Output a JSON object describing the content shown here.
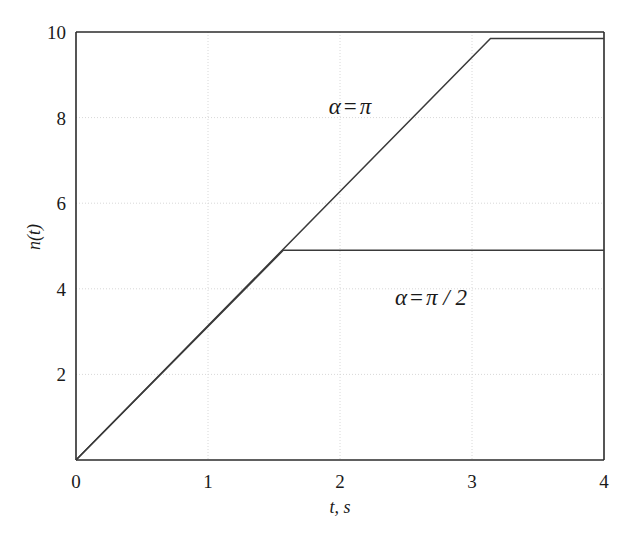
{
  "chart_data": {
    "type": "line",
    "title": "",
    "subtitle": "",
    "xlabel": "t, s",
    "ylabel": "n(t)",
    "xlim": [
      0,
      4
    ],
    "ylim": [
      0,
      10
    ],
    "xticks": [
      "0",
      "1",
      "2",
      "3",
      "4"
    ],
    "xtick_values": [
      0,
      1,
      2,
      3,
      4
    ],
    "yticks": [
      "2",
      "4",
      "6",
      "8",
      "10"
    ],
    "ytick_values": [
      2,
      4,
      6,
      8,
      10
    ],
    "grid": true,
    "grid_style": "dotted-faint",
    "legend_position": "inline-annotations",
    "line_color": "#3a3a3a",
    "axis_color": "#2b2b2b",
    "grid_color": "#d8d8d8",
    "background": "#ffffff",
    "series": [
      {
        "name": "alpha = pi",
        "annotation": "α = π",
        "annotation_x": 1.85,
        "annotation_y": 8.55,
        "x": [
          0,
          3.14,
          4
        ],
        "y": [
          0,
          9.85,
          9.85
        ]
      },
      {
        "name": "alpha = pi/2",
        "annotation": "α = π / 2",
        "annotation_x": 2.62,
        "annotation_y": 3.95,
        "x": [
          0,
          1.57,
          4
        ],
        "y": [
          0,
          4.9,
          4.9
        ]
      }
    ],
    "annotations": [
      {
        "text_alpha": "α",
        "text_eq": "=",
        "text_value": "π",
        "x": 1.85,
        "y": 8.55
      },
      {
        "text_alpha": "α",
        "text_eq": "=",
        "text_value": "π / 2",
        "x": 2.62,
        "y": 3.95
      }
    ]
  }
}
